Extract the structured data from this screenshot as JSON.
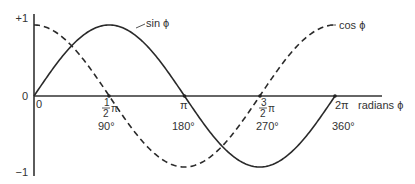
{
  "chart_data": {
    "type": "line",
    "title": "",
    "xlabel": "radians ϕ",
    "ylabel": "",
    "xlim": [
      0,
      6.2832
    ],
    "ylim": [
      -1,
      1
    ],
    "grid": false,
    "legend_position": "inline labels",
    "y_ticks": [
      {
        "value": 1,
        "label": "+1"
      },
      {
        "value": 0,
        "label": "0"
      },
      {
        "value": -1,
        "label": "−1"
      }
    ],
    "x_ticks": [
      {
        "value": 0,
        "label": "0",
        "degrees": ""
      },
      {
        "value": 1.5708,
        "label_num": "1",
        "label_den": "2",
        "label_sym": "π",
        "degrees": "90°"
      },
      {
        "value": 3.1416,
        "label": "π",
        "degrees": "180°"
      },
      {
        "value": 4.7124,
        "label_num": "3",
        "label_den": "2",
        "label_sym": "π",
        "degrees": "270°"
      },
      {
        "value": 6.2832,
        "label": "2π",
        "degrees": "360°"
      }
    ],
    "x": [
      0,
      0.7854,
      1.5708,
      2.3562,
      3.1416,
      3.927,
      4.7124,
      5.4978,
      6.2832
    ],
    "series": [
      {
        "name": "sin ϕ",
        "style": "solid",
        "values": [
          0,
          0.707,
          1,
          0.707,
          0,
          -0.707,
          -1,
          -0.707,
          0
        ]
      },
      {
        "name": "cos ϕ",
        "style": "dashed",
        "values": [
          1,
          0.707,
          0,
          -0.707,
          -1,
          -0.707,
          0,
          0.707,
          1
        ]
      }
    ]
  },
  "labels": {
    "y_top": "+1",
    "y_zero": "0",
    "y_bottom": "−1",
    "x_zero": "0",
    "half_pi_num": "1",
    "half_pi_den": "2",
    "pi_sym": "π",
    "deg_90": "90°",
    "pi": "π",
    "deg_180": "180°",
    "three_half_num": "3",
    "three_half_den": "2",
    "deg_270": "270°",
    "two_pi": "2π",
    "deg_360": "360°",
    "axis_label": "radians ϕ",
    "sin_label": "sin ϕ",
    "cos_label": "cos ϕ"
  }
}
